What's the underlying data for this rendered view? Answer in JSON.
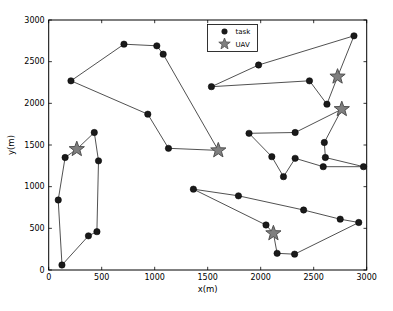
{
  "figure": {
    "background": "#ffffff",
    "width": 393,
    "height": 311
  },
  "chart_data": {
    "type": "scatter",
    "title": "",
    "xlabel": "x(m)",
    "ylabel": "y(m)",
    "xlim": [
      0,
      3000
    ],
    "ylim": [
      0,
      3000
    ],
    "xticks": [
      0,
      500,
      1000,
      1500,
      2000,
      2500,
      3000
    ],
    "yticks": [
      0,
      500,
      1000,
      1500,
      2000,
      2500,
      3000
    ],
    "grid": false,
    "box": true,
    "legend": {
      "position": "upper-center",
      "items": [
        {
          "label": "task",
          "marker": "circle",
          "color": "#1a1a1a"
        },
        {
          "label": "UAV",
          "marker": "star",
          "color": "#7f7f7f"
        }
      ]
    },
    "colors": {
      "task_marker": "#1a1a1a",
      "uav_fill": "#7f7f7f",
      "uav_edge": "#4f4f4f",
      "route_line": "#3d3d3d",
      "axis": "#000000"
    },
    "series": [
      {
        "name": "uav-tour-1",
        "uav": [
          1600,
          1435
        ],
        "tasks": [
          [
            1130,
            1460
          ],
          [
            935,
            1870
          ],
          [
            210,
            2270
          ],
          [
            710,
            2710
          ],
          [
            1020,
            2690
          ],
          [
            1080,
            2590
          ]
        ]
      },
      {
        "name": "uav-tour-2",
        "uav": [
          265,
          1450
        ],
        "tasks": [
          [
            155,
            1350
          ],
          [
            90,
            840
          ],
          [
            125,
            60
          ],
          [
            375,
            410
          ],
          [
            455,
            460
          ],
          [
            470,
            1310
          ],
          [
            430,
            1650
          ]
        ]
      },
      {
        "name": "uav-tour-3",
        "uav": [
          2725,
          2320
        ],
        "tasks": [
          [
            2625,
            1990
          ],
          [
            2460,
            2270
          ],
          [
            1535,
            2200
          ],
          [
            1980,
            2460
          ],
          [
            2880,
            2810
          ]
        ]
      },
      {
        "name": "uav-tour-4",
        "uav": [
          2765,
          1930
        ],
        "tasks": [
          [
            2600,
            1530
          ],
          [
            2610,
            1350
          ],
          [
            2970,
            1240
          ],
          [
            2590,
            1240
          ],
          [
            2325,
            1340
          ],
          [
            2215,
            1120
          ],
          [
            2105,
            1360
          ],
          [
            1890,
            1640
          ],
          [
            2325,
            1650
          ]
        ]
      },
      {
        "name": "uav-tour-5",
        "uav": [
          2120,
          440
        ],
        "tasks": [
          [
            2155,
            200
          ],
          [
            2320,
            190
          ],
          [
            2925,
            570
          ],
          [
            2750,
            610
          ],
          [
            2405,
            720
          ],
          [
            1790,
            890
          ],
          [
            1365,
            970
          ],
          [
            2050,
            540
          ]
        ]
      }
    ]
  }
}
